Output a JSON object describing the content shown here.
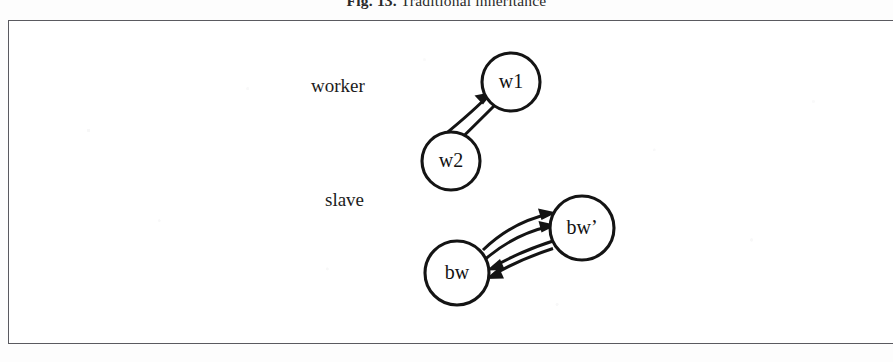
{
  "caption": {
    "label": "Fig. 13.",
    "text": "Traditional inheritance",
    "full": "Fig. 13. Traditional inheritance"
  },
  "figure": {
    "groups": [
      {
        "id": "worker",
        "label": "worker"
      },
      {
        "id": "slave",
        "label": "slave"
      }
    ],
    "nodes": [
      {
        "id": "w1",
        "label": "w1",
        "group": "worker",
        "cx": 511,
        "cy": 82,
        "r": 29
      },
      {
        "id": "w2",
        "label": "w2",
        "group": "worker",
        "cx": 451,
        "cy": 161,
        "r": 29
      },
      {
        "id": "bw",
        "label": "bw",
        "group": "slave",
        "cx": 457,
        "cy": 273,
        "r": 32
      },
      {
        "id": "bwp",
        "label": "bw’",
        "group": "slave",
        "cx": 582,
        "cy": 228,
        "r": 32
      }
    ],
    "edges": [
      {
        "from": "w2",
        "to": "w1",
        "direction": "w2->w1"
      },
      {
        "from": "w1",
        "to": "w2",
        "direction": "w1->w2"
      },
      {
        "from": "bw",
        "to": "bwp",
        "direction": "bw->bw'"
      },
      {
        "from": "bw",
        "to": "bwp",
        "direction": "bw->bw'"
      },
      {
        "from": "bwp",
        "to": "bw",
        "direction": "bw'->bw"
      },
      {
        "from": "bwp",
        "to": "bw",
        "direction": "bw'->bw"
      }
    ]
  },
  "colors": {
    "ink": "#141414",
    "frame_border": "#5a5a60",
    "page_background": "#fdfdfd",
    "node_fill": "#ffffff"
  }
}
